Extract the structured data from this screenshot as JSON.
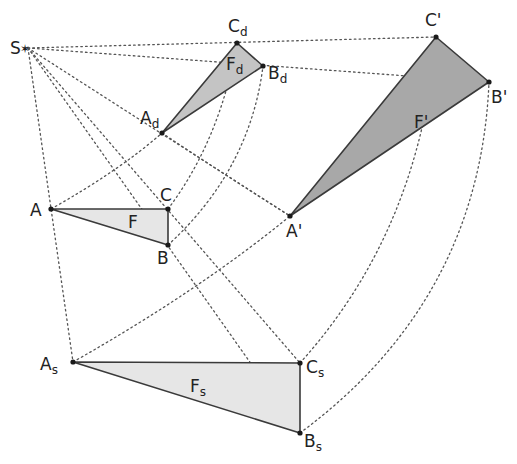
{
  "figure": {
    "center": {
      "label": "S"
    },
    "triangles": [
      {
        "id": "F",
        "name": "F",
        "sub": "",
        "shade": "light",
        "vertices": [
          {
            "n": "A",
            "s": ""
          },
          {
            "n": "B",
            "s": ""
          },
          {
            "n": "C",
            "s": ""
          }
        ]
      },
      {
        "id": "Fd",
        "name": "F",
        "sub": "d",
        "shade": "mid",
        "vertices": [
          {
            "n": "A",
            "s": "d"
          },
          {
            "n": "B",
            "s": "d"
          },
          {
            "n": "C",
            "s": "d"
          }
        ]
      },
      {
        "id": "Fp",
        "name": "F'",
        "sub": "",
        "shade": "dark",
        "vertices": [
          {
            "n": "A'",
            "s": ""
          },
          {
            "n": "B'",
            "s": ""
          },
          {
            "n": "C'",
            "s": ""
          }
        ]
      },
      {
        "id": "Fs",
        "name": "F",
        "sub": "s",
        "shade": "light",
        "vertices": [
          {
            "n": "A",
            "s": "s"
          },
          {
            "n": "B",
            "s": "s"
          },
          {
            "n": "C",
            "s": "s"
          }
        ]
      }
    ],
    "colors": {
      "line": "#555555",
      "edge": "#3a3a3a",
      "fill_light": "#e6e6e6",
      "fill_mid": "#c4c4c4",
      "fill_dark": "#a8a8a8"
    }
  }
}
